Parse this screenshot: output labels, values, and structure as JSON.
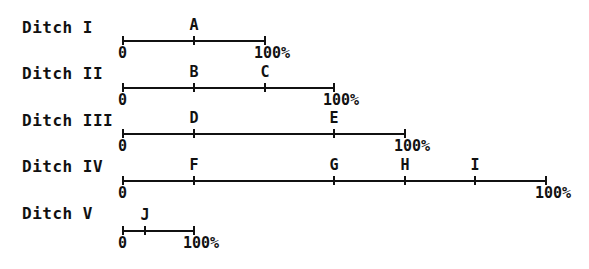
{
  "diagram": {
    "scale": {
      "zero_label": "0",
      "end_label": "100%"
    },
    "ditches": [
      {
        "label": "Ditch I",
        "y": 40,
        "x0": 122,
        "x1": 264,
        "label_y": 18,
        "markers": [
          {
            "name": "A",
            "x": 193
          }
        ]
      },
      {
        "label": "Ditch II",
        "y": 87,
        "x0": 122,
        "x1": 333,
        "label_y": 64,
        "markers": [
          {
            "name": "B",
            "x": 193
          },
          {
            "name": "C",
            "x": 264
          }
        ]
      },
      {
        "label": "Ditch III",
        "y": 133,
        "x0": 122,
        "x1": 404,
        "label_y": 111,
        "markers": [
          {
            "name": "D",
            "x": 193
          },
          {
            "name": "E",
            "x": 333
          }
        ]
      },
      {
        "label": "Ditch IV",
        "y": 180,
        "x0": 122,
        "x1": 545,
        "label_y": 157,
        "markers": [
          {
            "name": "F",
            "x": 193
          },
          {
            "name": "G",
            "x": 333
          },
          {
            "name": "H",
            "x": 404
          },
          {
            "name": "I",
            "x": 474
          }
        ]
      },
      {
        "label": "Ditch V",
        "y": 230,
        "x0": 122,
        "x1": 193,
        "label_y": 204,
        "markers": [
          {
            "name": "J",
            "x": 144
          }
        ]
      }
    ]
  }
}
